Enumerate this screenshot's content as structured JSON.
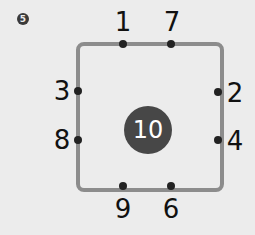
{
  "exercise": {
    "number": "5"
  },
  "puzzle": {
    "center_value": "10",
    "top": [
      "1",
      "7"
    ],
    "right": [
      "2",
      "4"
    ],
    "bottom": [
      "9",
      "6"
    ],
    "left": [
      "3",
      "8"
    ]
  },
  "colors": {
    "background": "#ececec",
    "square_stroke": "#8c8c8c",
    "center_fill": "#474747",
    "dot": "#222222"
  }
}
